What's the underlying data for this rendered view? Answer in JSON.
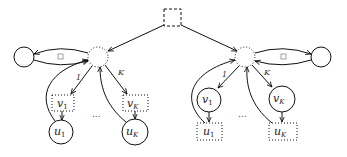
{
  "diagram": {
    "type": "graphical-model",
    "root": {
      "shape": "dashed-square"
    },
    "subtrees": [
      {
        "side": "left",
        "hub": {
          "shape": "dotted-circle"
        },
        "leaf": {
          "shape": "solid-circle"
        },
        "edge_labels": {
          "loop": "□",
          "first": "1",
          "last": "K"
        },
        "children": [
          {
            "v_label": "v",
            "v_sub": "1",
            "v_shape": "dotted-box",
            "u_label": "u",
            "u_sub": "1",
            "u_shape": "solid-circle"
          },
          {
            "v_label": "v",
            "v_sub": "K",
            "v_shape": "dotted-box",
            "u_label": "u",
            "u_sub": "K",
            "u_shape": "solid-circle"
          }
        ],
        "ellipsis": "..."
      },
      {
        "side": "right",
        "hub": {
          "shape": "dotted-circle"
        },
        "leaf": {
          "shape": "solid-circle"
        },
        "edge_labels": {
          "loop": "□",
          "first": "1",
          "last": "K"
        },
        "children": [
          {
            "v_label": "v",
            "v_sub": "1",
            "v_shape": "solid-circle",
            "u_label": "u",
            "u_sub": "1",
            "u_shape": "dotted-box"
          },
          {
            "v_label": "v",
            "v_sub": "K",
            "v_shape": "solid-circle",
            "u_label": "u",
            "u_sub": "K",
            "u_shape": "dotted-box"
          }
        ],
        "ellipsis": "..."
      }
    ]
  }
}
